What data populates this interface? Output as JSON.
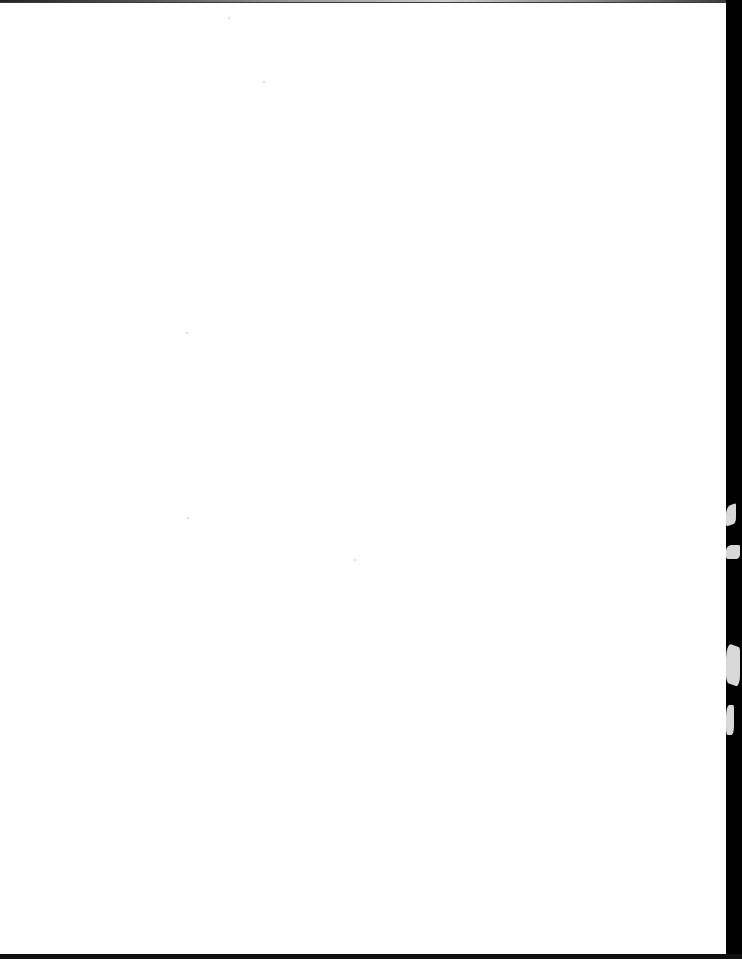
{
  "document": {
    "type": "blank scanned page",
    "text": "",
    "colors": {
      "paper": "#ffffff",
      "scan_background": "#000000"
    }
  }
}
